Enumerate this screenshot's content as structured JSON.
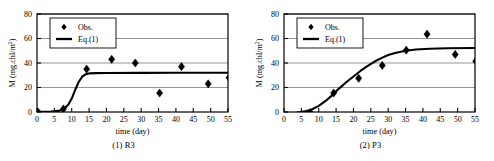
{
  "figure": {
    "panels": [
      {
        "caption": "(1) R3",
        "legend": {
          "marker_label": "Obs.",
          "line_label": "Eq.(1)"
        },
        "chart_data": {
          "type": "scatter",
          "title": "",
          "xlabel": "time (day)",
          "ylabel": "M (mg.chl/m2)",
          "ylabel_display": "M (mg.chl/m",
          "ylabel_exponent": "2",
          "ylabel_tail": ")",
          "xlim": [
            0,
            55
          ],
          "ylim": [
            0,
            80
          ],
          "xticks": [
            0,
            5,
            10,
            15,
            20,
            25,
            30,
            35,
            40,
            45,
            50,
            55
          ],
          "yticks": [
            0,
            20,
            40,
            60,
            80
          ],
          "grid": true,
          "grid_axis": "y",
          "legend_position": "upper-left",
          "series": [
            {
              "name": "Obs.",
              "type": "scatter",
              "marker": "diamond",
              "color": "#000000",
              "points": [
                {
                  "x": 0.3,
                  "y": 0.0
                },
                {
                  "x": 7.6,
                  "y": 2.5
                },
                {
                  "x": 14.3,
                  "y": 35.0
                },
                {
                  "x": 21.5,
                  "y": 43.0
                },
                {
                  "x": 28.3,
                  "y": 40.0
                },
                {
                  "x": 35.3,
                  "y": 15.5
                },
                {
                  "x": 41.6,
                  "y": 37.0
                },
                {
                  "x": 49.3,
                  "y": 23.0
                },
                {
                  "x": 55.3,
                  "y": 28.0
                }
              ]
            },
            {
              "name": "Eq.(1)",
              "type": "line",
              "color": "#000000",
              "points": [
                {
                  "x": 0,
                  "y": 0.2
                },
                {
                  "x": 4,
                  "y": 0.4
                },
                {
                  "x": 6,
                  "y": 0.9
                },
                {
                  "x": 7,
                  "y": 1.6
                },
                {
                  "x": 8,
                  "y": 3.0
                },
                {
                  "x": 9,
                  "y": 6.0
                },
                {
                  "x": 10,
                  "y": 11.0
                },
                {
                  "x": 11,
                  "y": 18.0
                },
                {
                  "x": 12,
                  "y": 24.5
                },
                {
                  "x": 13,
                  "y": 28.8
                },
                {
                  "x": 14,
                  "y": 30.8
                },
                {
                  "x": 15,
                  "y": 31.5
                },
                {
                  "x": 17,
                  "y": 31.7
                },
                {
                  "x": 20,
                  "y": 31.8
                },
                {
                  "x": 30,
                  "y": 31.9
                },
                {
                  "x": 40,
                  "y": 32.0
                },
                {
                  "x": 55,
                  "y": 32.1
                }
              ]
            }
          ]
        }
      },
      {
        "caption": "(2) P3",
        "legend": {
          "marker_label": "Obs.",
          "line_label": "Eq.(1)"
        },
        "chart_data": {
          "type": "scatter",
          "title": "",
          "xlabel": "time (day)",
          "ylabel": "M (mg.chl/m2)",
          "ylabel_display": "M (mg.chl/m",
          "ylabel_exponent": "2",
          "ylabel_tail": ")",
          "xlim": [
            0,
            55
          ],
          "ylim": [
            0,
            80
          ],
          "xticks": [
            0,
            5,
            10,
            15,
            20,
            25,
            30,
            35,
            40,
            45,
            50,
            55
          ],
          "yticks": [
            0,
            20,
            40,
            60,
            80
          ],
          "grid": true,
          "grid_axis": "y",
          "legend_position": "upper-left",
          "series": [
            {
              "name": "Obs.",
              "type": "scatter",
              "marker": "diamond",
              "color": "#000000",
              "points": [
                {
                  "x": 0.3,
                  "y": -2.5
                },
                {
                  "x": 7.6,
                  "y": -0.5
                },
                {
                  "x": 14.3,
                  "y": 15.5
                },
                {
                  "x": 21.5,
                  "y": 27.5
                },
                {
                  "x": 28.3,
                  "y": 38.0
                },
                {
                  "x": 35.2,
                  "y": 50.5
                },
                {
                  "x": 41.2,
                  "y": 63.5
                },
                {
                  "x": 49.3,
                  "y": 47.0
                },
                {
                  "x": 55.2,
                  "y": 41.5
                }
              ]
            },
            {
              "name": "Eq.(1)",
              "type": "line",
              "color": "#000000",
              "points": [
                {
                  "x": 0,
                  "y": -2.0
                },
                {
                  "x": 3,
                  "y": -1.0
                },
                {
                  "x": 6,
                  "y": 0.5
                },
                {
                  "x": 8,
                  "y": 2.0
                },
                {
                  "x": 10,
                  "y": 5.0
                },
                {
                  "x": 12,
                  "y": 9.0
                },
                {
                  "x": 14,
                  "y": 14.0
                },
                {
                  "x": 16,
                  "y": 19.5
                },
                {
                  "x": 18,
                  "y": 24.5
                },
                {
                  "x": 20,
                  "y": 29.0
                },
                {
                  "x": 22,
                  "y": 33.5
                },
                {
                  "x": 24,
                  "y": 37.5
                },
                {
                  "x": 26,
                  "y": 41.0
                },
                {
                  "x": 28,
                  "y": 44.0
                },
                {
                  "x": 30,
                  "y": 46.5
                },
                {
                  "x": 32,
                  "y": 48.2
                },
                {
                  "x": 35,
                  "y": 50.0
                },
                {
                  "x": 38,
                  "y": 51.0
                },
                {
                  "x": 42,
                  "y": 51.6
                },
                {
                  "x": 47,
                  "y": 52.0
                },
                {
                  "x": 55,
                  "y": 52.2
                }
              ]
            }
          ]
        }
      }
    ]
  }
}
